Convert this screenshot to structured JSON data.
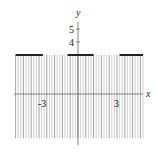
{
  "chart_data": {
    "type": "line",
    "title": "",
    "xlabel": "x",
    "ylabel": "y",
    "x_ticks": [
      -3,
      3
    ],
    "y_ticks": [
      4,
      5
    ],
    "x_tick_labels": [
      "-3",
      "3"
    ],
    "y_tick_labels": [
      "4",
      "5"
    ],
    "xlim": [
      -4.8,
      5.1
    ],
    "ylim": [
      -3.4,
      5.5
    ],
    "grid": false,
    "legend": null,
    "segments": [
      {
        "x": [
          -4.8,
          -2.7
        ],
        "y": [
          3,
          3
        ]
      },
      {
        "x": [
          -0.8,
          1.2
        ],
        "y": [
          3,
          3
        ]
      },
      {
        "x": [
          3.2,
          5.0
        ],
        "y": [
          3,
          3
        ]
      }
    ],
    "shaded_region": {
      "description": "vertical hatch shading below y = 3",
      "x": [
        -4.8,
        5.0
      ],
      "y_top": 3,
      "y_bottom": -3.4
    },
    "colors": {
      "segment": "#222222",
      "hatch": "#9a9a9a",
      "axis": "#555555"
    }
  },
  "labels": {
    "x_axis": "x",
    "y_axis": "y",
    "tick_neg3": "-3",
    "tick_3": "3",
    "tick_4": "4",
    "tick_5": "5"
  }
}
